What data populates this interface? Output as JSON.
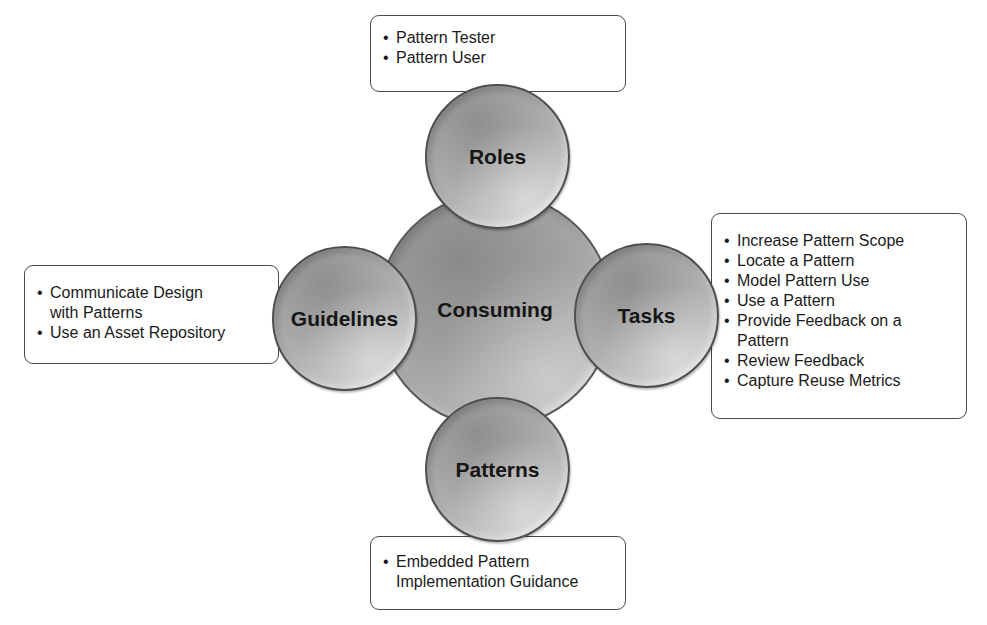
{
  "diagram": {
    "center": {
      "label": "Consuming"
    },
    "nodes": {
      "roles": {
        "label": "Roles",
        "items": [
          "Pattern Tester",
          "Pattern User"
        ]
      },
      "tasks": {
        "label": "Tasks",
        "items": [
          "Increase Pattern Scope",
          "Locate a Pattern",
          "Model Pattern Use",
          "Use a Pattern",
          "Provide Feedback on a Pattern",
          "Review Feedback",
          "Capture Reuse Metrics"
        ]
      },
      "guidelines": {
        "label": "Guidelines",
        "items": [
          "Communicate Design with Patterns",
          "Use an Asset Repository"
        ]
      },
      "patterns": {
        "label": "Patterns",
        "items": [
          "Embedded Pattern Implementation Guidance"
        ]
      }
    },
    "colors": {
      "circle_fill": "#a8a8a8",
      "circle_border": "#4e4e4e",
      "box_border": "#4a4a4a",
      "text": "#1a1a1a"
    }
  }
}
